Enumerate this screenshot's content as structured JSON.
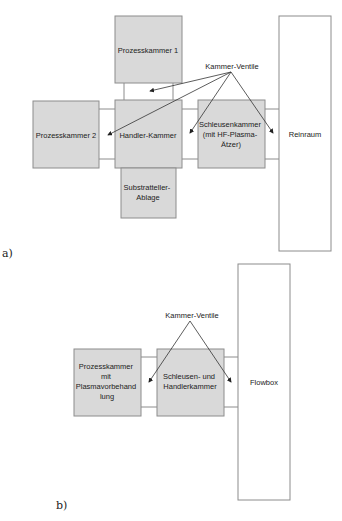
{
  "diagram_a": {
    "caption": "a)",
    "valve_label": "Kammer-Ventile",
    "chambers": {
      "pk1": [
        "Prozesskammer 1"
      ],
      "pk2": [
        "Prozesskammer 2"
      ],
      "handler": [
        "Handler-Kammer"
      ],
      "schleuse": [
        "Schleusenkammer",
        "(mit HF-Plasma-",
        "Ätzer)"
      ],
      "ablage": [
        "Substratteller-",
        "Ablage"
      ],
      "reinraum": [
        "Reinraum"
      ]
    }
  },
  "diagram_b": {
    "caption": "b)",
    "valve_label": "Kammer-Ventile",
    "chambers": {
      "pk": [
        "Prozesskammer",
        "mit",
        "Plasmavorbehand",
        "lung"
      ],
      "schleuse": [
        "Schleusen- und",
        "Handlerkammer"
      ],
      "flowbox": [
        "Flowbox"
      ]
    }
  }
}
